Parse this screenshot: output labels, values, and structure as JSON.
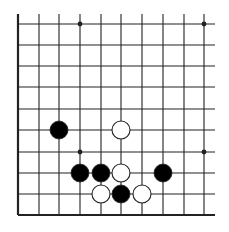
{
  "board": {
    "description": "Go board corner diagram (left and bottom edges)",
    "columns": 10,
    "rows": 10,
    "col_x": [
      18,
      39,
      59,
      80,
      101,
      121,
      142,
      163,
      184,
      204
    ],
    "row_y": [
      24,
      45,
      66,
      87,
      109,
      130,
      152,
      173,
      194,
      215
    ],
    "line_top": 14,
    "line_right": 215,
    "edges": [
      "left",
      "bottom"
    ],
    "line_color": "#222222",
    "stone_radius": 9,
    "colors": {
      "black": "#000000",
      "white": "#ffffff",
      "stone_outline": "#222222"
    },
    "star_points": [
      {
        "col": 3,
        "row": 0
      },
      {
        "col": 9,
        "row": 0
      },
      {
        "col": 3,
        "row": 6
      },
      {
        "col": 9,
        "row": 6
      }
    ],
    "stones": [
      {
        "color": "black",
        "col": 2,
        "row": 5
      },
      {
        "color": "white",
        "col": 5,
        "row": 5
      },
      {
        "color": "black",
        "col": 3,
        "row": 7
      },
      {
        "color": "black",
        "col": 4,
        "row": 7
      },
      {
        "color": "white",
        "col": 5,
        "row": 7
      },
      {
        "color": "black",
        "col": 7,
        "row": 7
      },
      {
        "color": "white",
        "col": 4,
        "row": 8
      },
      {
        "color": "black",
        "col": 5,
        "row": 8
      },
      {
        "color": "white",
        "col": 6,
        "row": 8
      }
    ]
  }
}
